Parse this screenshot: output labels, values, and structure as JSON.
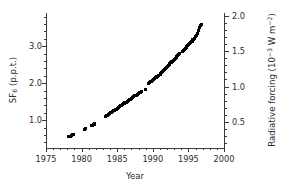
{
  "chart_data": {
    "type": "scatter",
    "title": "",
    "xlabel": "Year",
    "ylabel": "SF6 (p.p.t.)",
    "ylabel_right": "Radiative forcing (10-3 W m-2)",
    "xlim": [
      1975,
      2000
    ],
    "ylim": [
      0.25,
      3.9
    ],
    "ylim_right": [
      0.13,
      2.04
    ],
    "grid": false,
    "legend": null,
    "marker": "square",
    "marker_color": "#000000",
    "xticks": [
      1975,
      1980,
      1985,
      1990,
      1995,
      2000
    ],
    "xticklabels": [
      "1975",
      "1980",
      "1985",
      "1990",
      "1995",
      "2000"
    ],
    "yticks_left": [
      1.0,
      2.0,
      3.0
    ],
    "yticklabels_left": [
      "1.0",
      "2.0",
      "3.0"
    ],
    "yticks_right": [
      0.5,
      1.0,
      1.5,
      2.0
    ],
    "yticklabels_right": [
      "0.5",
      "1.0",
      "1.5",
      "2.0"
    ],
    "minor_tick_interval_x": 1,
    "minor_tick_interval_y_left": 0.2,
    "minor_tick_interval_y_right": 0.1,
    "right_axis_scale_factor": 0.523,
    "points": [
      [
        1978.15,
        0.56
      ],
      [
        1978.3,
        0.57
      ],
      [
        1978.45,
        0.57
      ],
      [
        1978.6,
        0.6
      ],
      [
        1978.75,
        0.61
      ],
      [
        1978.9,
        0.62
      ],
      [
        1980.45,
        0.76
      ],
      [
        1980.6,
        0.78
      ],
      [
        1981.35,
        0.86
      ],
      [
        1981.5,
        0.87
      ],
      [
        1981.65,
        0.89
      ],
      [
        1981.8,
        0.9
      ],
      [
        1983.35,
        1.1
      ],
      [
        1983.5,
        1.12
      ],
      [
        1983.65,
        1.14
      ],
      [
        1983.8,
        1.16
      ],
      [
        1983.95,
        1.18
      ],
      [
        1984.1,
        1.2
      ],
      [
        1984.25,
        1.22
      ],
      [
        1984.4,
        1.24
      ],
      [
        1984.55,
        1.26
      ],
      [
        1984.7,
        1.28
      ],
      [
        1984.85,
        1.3
      ],
      [
        1985.05,
        1.33
      ],
      [
        1985.2,
        1.35
      ],
      [
        1985.35,
        1.37
      ],
      [
        1985.5,
        1.39
      ],
      [
        1985.65,
        1.41
      ],
      [
        1985.8,
        1.43
      ],
      [
        1985.95,
        1.45
      ],
      [
        1986.1,
        1.47
      ],
      [
        1986.25,
        1.49
      ],
      [
        1986.4,
        1.51
      ],
      [
        1986.55,
        1.53
      ],
      [
        1986.7,
        1.55
      ],
      [
        1986.85,
        1.57
      ],
      [
        1987.05,
        1.6
      ],
      [
        1987.2,
        1.62
      ],
      [
        1987.35,
        1.64
      ],
      [
        1987.5,
        1.66
      ],
      [
        1987.65,
        1.68
      ],
      [
        1987.8,
        1.7
      ],
      [
        1987.95,
        1.72
      ],
      [
        1988.1,
        1.74
      ],
      [
        1988.25,
        1.76
      ],
      [
        1988.4,
        1.78
      ],
      [
        1988.95,
        1.83
      ],
      [
        1989.45,
        1.99
      ],
      [
        1989.6,
        2.01
      ],
      [
        1989.75,
        2.04
      ],
      [
        1989.9,
        2.07
      ],
      [
        1990.1,
        2.1
      ],
      [
        1990.25,
        2.13
      ],
      [
        1990.4,
        2.15
      ],
      [
        1990.55,
        2.17
      ],
      [
        1990.7,
        2.19
      ],
      [
        1990.85,
        2.21
      ],
      [
        1991.05,
        2.25
      ],
      [
        1991.2,
        2.28
      ],
      [
        1991.35,
        2.31
      ],
      [
        1991.5,
        2.34
      ],
      [
        1991.65,
        2.37
      ],
      [
        1991.8,
        2.4
      ],
      [
        1991.95,
        2.43
      ],
      [
        1992.1,
        2.46
      ],
      [
        1992.25,
        2.49
      ],
      [
        1992.4,
        2.52
      ],
      [
        1992.55,
        2.55
      ],
      [
        1992.7,
        2.58
      ],
      [
        1992.85,
        2.61
      ],
      [
        1993.05,
        2.65
      ],
      [
        1993.2,
        2.68
      ],
      [
        1993.35,
        2.71
      ],
      [
        1993.5,
        2.74
      ],
      [
        1993.65,
        2.77
      ],
      [
        1993.8,
        2.8
      ],
      [
        1994.15,
        2.86
      ],
      [
        1994.3,
        2.89
      ],
      [
        1994.45,
        2.92
      ],
      [
        1994.6,
        2.95
      ],
      [
        1994.75,
        2.98
      ],
      [
        1994.9,
        3.01
      ],
      [
        1995.05,
        3.04
      ],
      [
        1995.2,
        3.07
      ],
      [
        1995.35,
        3.1
      ],
      [
        1995.5,
        3.14
      ],
      [
        1995.65,
        3.18
      ],
      [
        1995.8,
        3.22
      ],
      [
        1995.95,
        3.26
      ],
      [
        1996.1,
        3.3
      ],
      [
        1996.25,
        3.35
      ],
      [
        1996.4,
        3.42
      ],
      [
        1996.55,
        3.5
      ],
      [
        1996.7,
        3.56
      ],
      [
        1996.8,
        3.6
      ]
    ]
  },
  "axes": {
    "x_title": "Year",
    "y_left_title_main": "SF",
    "y_left_title_sub": "6",
    "y_left_title_rest": " (p.p.t.)",
    "y_right_title_main": "Radiative forcing (10",
    "y_right_title_sup1": "−3",
    "y_right_title_mid": " W m",
    "y_right_title_sup2": "−2",
    "y_right_title_end": ")"
  }
}
